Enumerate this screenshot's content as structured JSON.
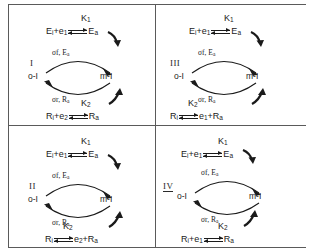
{
  "figure": {
    "layout": "2x2 grid separated by a vertical rule and a horizontal rule"
  },
  "symbols": {
    "equilibrium_arrow": "double-half-arrow",
    "feed_arrow": "curved-bold-arrow",
    "cycle_top_arrow": "arc-arrow-right",
    "cycle_bottom_arrow": "arc-arrow-left"
  },
  "cycle": {
    "left_node": "o-I",
    "right_node": "m-I",
    "top_label_main": "σf",
    "top_label_rest": ", E",
    "top_label_sub": "a",
    "bottom_label_main": "σr",
    "bottom_label_rest": ", R",
    "bottom_label_sub": "a"
  },
  "panels": [
    {
      "id": "panel-I",
      "roman": "I",
      "roman_underlined": false,
      "top_constant": "K",
      "top_constant_sub": "1",
      "top_left": "E",
      "top_left_sub": "i",
      "top_left_plus": "+e",
      "top_left_plus_sub": "1",
      "top_right": "E",
      "top_right_sub": "a",
      "bottom_constant": "K",
      "bottom_constant_sub": "2",
      "bottom_left": "R",
      "bottom_left_sub": "i",
      "bottom_left_plus": "+e",
      "bottom_left_plus_sub": "2",
      "bottom_right": "R",
      "bottom_right_sub": "a",
      "bottom_right_extra": "",
      "bottom_right_extra_sub": ""
    },
    {
      "id": "panel-III",
      "roman": "III",
      "roman_underlined": false,
      "top_constant": "K",
      "top_constant_sub": "1",
      "top_left": "E",
      "top_left_sub": "i",
      "top_left_plus": "+e",
      "top_left_plus_sub": "1",
      "top_right": "E",
      "top_right_sub": "a",
      "bottom_constant": "K",
      "bottom_constant_sub": "2",
      "bottom_left": "R",
      "bottom_left_sub": "i",
      "bottom_left_plus": "",
      "bottom_left_plus_sub": "",
      "bottom_right": "e",
      "bottom_right_sub": "1",
      "bottom_right_extra": "+R",
      "bottom_right_extra_sub": "a"
    },
    {
      "id": "panel-II",
      "roman": "II",
      "roman_underlined": false,
      "top_constant": "K",
      "top_constant_sub": "1",
      "top_left": "E",
      "top_left_sub": "i",
      "top_left_plus": "+e",
      "top_left_plus_sub": "1",
      "top_right": "E",
      "top_right_sub": "a",
      "bottom_constant": "K",
      "bottom_constant_sub": "2",
      "bottom_left": "R",
      "bottom_left_sub": "i",
      "bottom_left_plus": "",
      "bottom_left_plus_sub": "",
      "bottom_right": "e",
      "bottom_right_sub": "2",
      "bottom_right_extra": "+R",
      "bottom_right_extra_sub": "a"
    },
    {
      "id": "panel-IV",
      "roman": "IV",
      "roman_underlined": true,
      "top_constant": "K",
      "top_constant_sub": "1",
      "top_left": "E",
      "top_left_sub": "i",
      "top_left_plus": "+e",
      "top_left_plus_sub": "1",
      "top_right": "E",
      "top_right_sub": "a",
      "bottom_constant": "K",
      "bottom_constant_sub": "2",
      "bottom_left": "R",
      "bottom_left_sub": "i",
      "bottom_left_plus": "+e",
      "bottom_left_plus_sub": "1",
      "bottom_right": "R",
      "bottom_right_sub": "a",
      "bottom_right_extra": "",
      "bottom_right_extra_sub": ""
    }
  ]
}
